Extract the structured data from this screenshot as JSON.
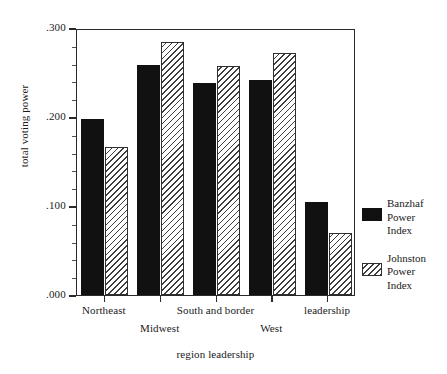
{
  "chart_data": {
    "type": "bar",
    "title": "",
    "xlabel": "region leadership",
    "ylabel": "total voting power",
    "ylim": [
      0.0,
      0.3
    ],
    "ytick_labels": [
      ".000",
      ".100",
      ".200",
      ".300"
    ],
    "ytick_values": [
      0.0,
      0.1,
      0.2,
      0.3
    ],
    "yminor_step": 0.02,
    "grid": false,
    "legend_position": "right",
    "categories": [
      "Northeast",
      "Midwest",
      "South and border",
      "West",
      "leadership"
    ],
    "category_rows": [
      0,
      1,
      0,
      1,
      0
    ],
    "series": [
      {
        "name": "Banzhaf Power Index",
        "legend_lines": [
          "Banzhaf",
          "Power",
          "Index"
        ],
        "fill": "solid-black",
        "color": "#111111",
        "values": [
          0.198,
          0.258,
          0.238,
          0.242,
          0.104
        ]
      },
      {
        "name": "Johnston Power Index",
        "legend_lines": [
          "Johnston",
          "Power",
          "Index"
        ],
        "fill": "diagonal-hatch",
        "color": "#3d3d3d",
        "values": [
          0.166,
          0.284,
          0.257,
          0.272,
          0.07
        ]
      }
    ]
  },
  "axes": {
    "y_title": "total voting power",
    "x_title": "region leadership"
  }
}
